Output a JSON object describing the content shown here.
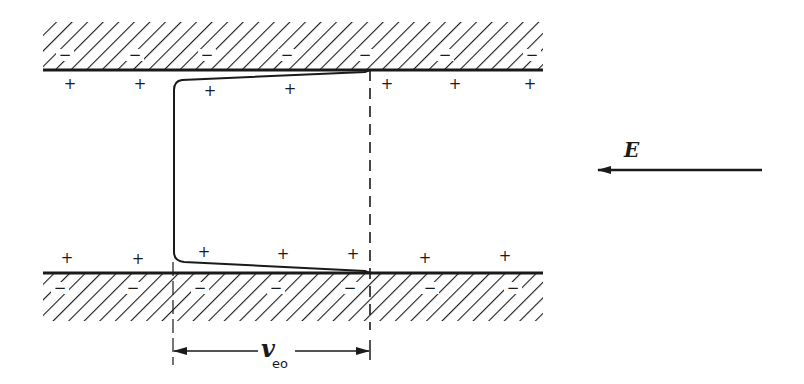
{
  "diagram": {
    "type": "electroosmotic-flow-schematic",
    "colors": {
      "ink": "#1a1a1a",
      "background": "#ffffff"
    },
    "field": {
      "label": "E",
      "direction": "left"
    },
    "velocity": {
      "symbol": "v",
      "subscript": "eo"
    },
    "top_wall": {
      "wall_charge": "−",
      "wall_charge_x": [
        65,
        135,
        207,
        287,
        365,
        445,
        532
      ],
      "counter_ion": "+",
      "counter_ion_points": [
        [
          70,
          84
        ],
        [
          140,
          84
        ],
        [
          210,
          91
        ],
        [
          290,
          89
        ],
        [
          387,
          84
        ],
        [
          455,
          84
        ],
        [
          530,
          84
        ]
      ]
    },
    "bottom_wall": {
      "wall_charge": "−",
      "wall_charge_x": [
        60,
        133,
        200,
        276,
        350,
        430,
        513
      ],
      "counter_ion": "+",
      "counter_ion_points": [
        [
          67,
          258
        ],
        [
          138,
          259
        ],
        [
          204,
          252
        ],
        [
          283,
          254
        ],
        [
          353,
          254
        ],
        [
          425,
          258
        ],
        [
          505,
          256
        ]
      ]
    }
  }
}
